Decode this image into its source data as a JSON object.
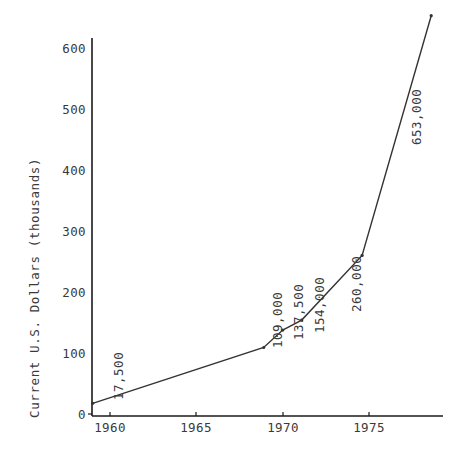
{
  "chart_data": {
    "type": "line",
    "title": "",
    "subtitle": "",
    "xlabel": "",
    "ylabel": "Current U.S. Dollars (thousands)",
    "xlim": [
      1958.6,
      1979.5
    ],
    "ylim": [
      0,
      660
    ],
    "grid": false,
    "legend": "none",
    "x_ticks": [
      "1960",
      "1965",
      "1970",
      "1975"
    ],
    "x_tick_values": [
      1960,
      1965,
      1970,
      1975
    ],
    "y_ticks": [
      "0",
      "100",
      "200",
      "300",
      "400",
      "500",
      "600"
    ],
    "y_tick_values": [
      0,
      100,
      200,
      300,
      400,
      500,
      600
    ],
    "series": [
      {
        "name": "Current U.S. Dollars",
        "x": [
          1959.0,
          1968.9,
          1970.0,
          1971.1,
          1974.6,
          1978.6
        ],
        "y": [
          17.5,
          109.0,
          137.5,
          154.0,
          260.0,
          653.0
        ],
        "point_labels": [
          "17,500",
          "109,000",
          "137,500",
          "154,000",
          "260,000",
          "653,000"
        ],
        "color": "#333333"
      }
    ]
  },
  "annotations": {
    "label_0": "17,500",
    "label_1": "109,000",
    "label_2": "137,500",
    "label_3": "154,000",
    "label_4": "260,000",
    "label_5": "653,000"
  },
  "axes": {
    "y_title": "Current U.S. Dollars (thousands)",
    "y_tick_0": "0",
    "y_tick_1": "100",
    "y_tick_2": "200",
    "y_tick_3": "300",
    "y_tick_4": "400",
    "y_tick_5": "500",
    "y_tick_6": "600",
    "x_tick_0": "1960",
    "x_tick_1": "1965",
    "x_tick_2": "1970",
    "x_tick_3": "1975"
  },
  "colors": {
    "line": "#333333",
    "axis": "#1a1a1a",
    "text": "#3a3a3a",
    "background": "#ffffff"
  }
}
